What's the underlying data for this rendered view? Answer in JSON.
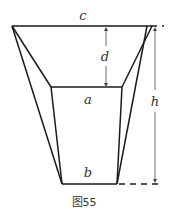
{
  "diagram": {
    "type": "frustum-trapezoid",
    "caption": "图55",
    "labels": {
      "top_edge": "c",
      "inner_edge": "a",
      "bottom_edge": "b",
      "depth": "d",
      "height": "h"
    },
    "colors": {
      "stroke": "#1a1a1a",
      "dimension": "#444444",
      "text": "#333333"
    }
  }
}
